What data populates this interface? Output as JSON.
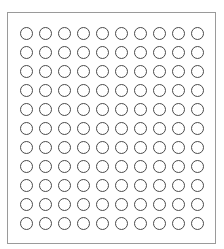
{
  "grid": {
    "rows": 11,
    "columns": 10,
    "cell_shape": "circle-outline-icon",
    "circle_stroke_color": "#4a4a4a",
    "border_color": "#9a9a9a",
    "filled_cells": []
  }
}
